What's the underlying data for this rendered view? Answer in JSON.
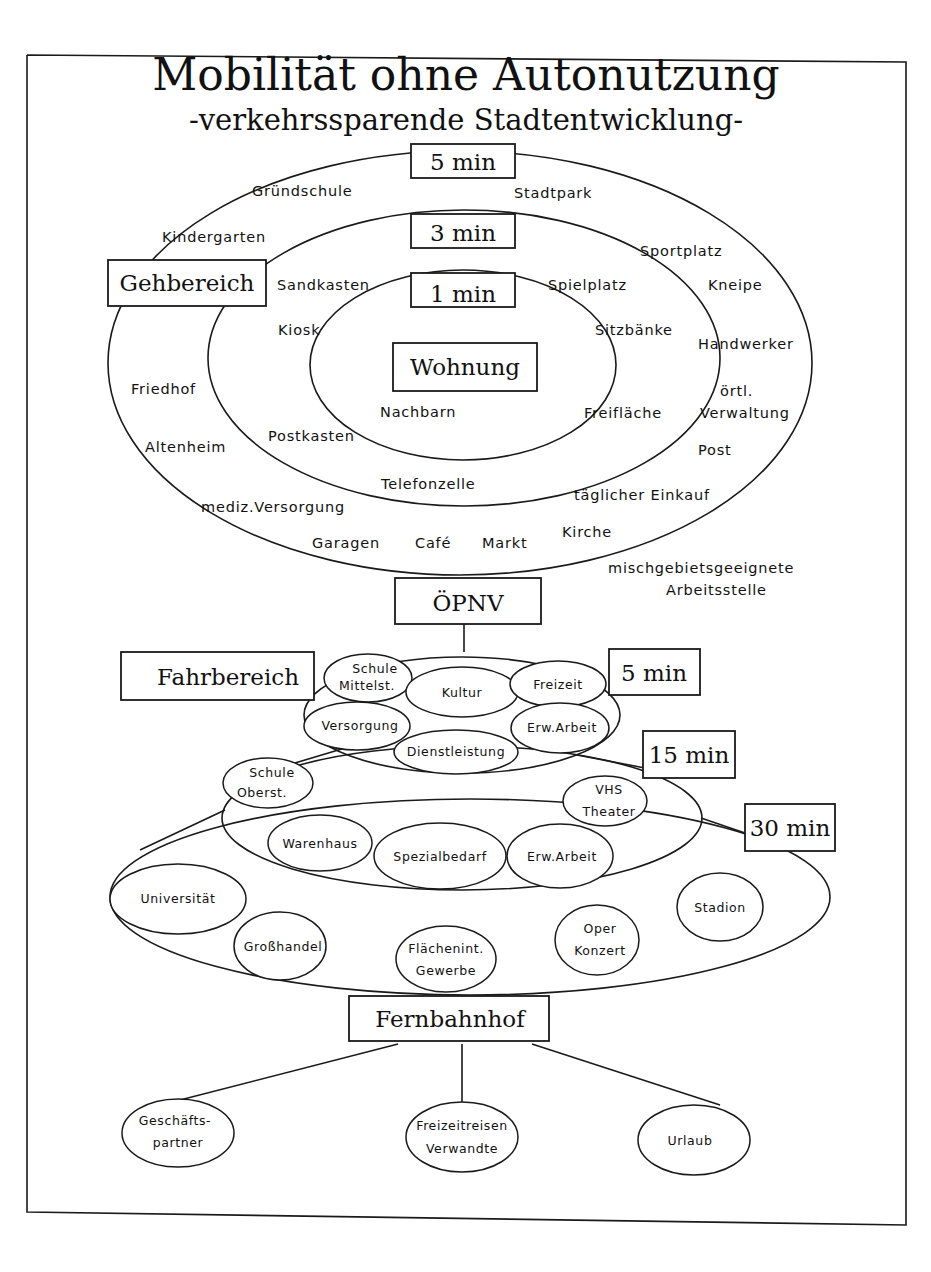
{
  "title": "Mobilität ohne Autonutzung",
  "subtitle": "-verkehrssparende Stadtentwicklung-",
  "gehbereich": {
    "label": "Gehbereich",
    "center_label": "Wohnung",
    "rings": [
      {
        "time": "1 min",
        "items": [
          "Nachbarn"
        ]
      },
      {
        "time": "3 min",
        "items": [
          "Sandkasten",
          "Spielplatz",
          "Kiosk",
          "Sitzbänke",
          "Freifläche",
          "Postkasten",
          "Telefonzelle"
        ]
      },
      {
        "time": "5 min",
        "items": [
          "Gründschule",
          "Stadtpark",
          "Kindergarten",
          "Sportplatz",
          "Kneipe",
          "Handwerker",
          "Friedhof",
          "örtl.",
          "Verwaltung",
          "Altenheim",
          "Post",
          "täglicher Einkauf",
          "mediz.Versorgung",
          "Garagen",
          "Café",
          "Markt",
          "Kirche"
        ]
      }
    ],
    "outside_note": [
      "mischgebietsgeeignete",
      "Arbeitsstelle"
    ]
  },
  "oepnv": {
    "label": "ÖPNV"
  },
  "fahrbereich": {
    "label": "Fahrbereich",
    "rings": [
      {
        "time": "5 min",
        "items": [
          [
            "Schule",
            "Mittelst."
          ],
          [
            "Kultur"
          ],
          [
            "Freizeit"
          ],
          [
            "Versorgung"
          ],
          [
            "Erw.Arbeit"
          ],
          [
            "Dienstleistung"
          ]
        ]
      },
      {
        "time": "15 min",
        "items": [
          [
            "Schule",
            "Oberst."
          ],
          [
            "VHS",
            "Theater"
          ],
          [
            "Warenhaus"
          ],
          [
            "Spezialbedarf"
          ],
          [
            "Erw.Arbeit"
          ]
        ]
      },
      {
        "time": "30 min",
        "items": [
          [
            "Universität"
          ],
          [
            "Stadion"
          ],
          [
            "Großhandel"
          ],
          [
            "Flächenint.",
            "Gewerbe"
          ],
          [
            "Oper",
            "Konzert"
          ]
        ]
      }
    ]
  },
  "fernbahnhof": {
    "label": "Fernbahnhof",
    "destinations": [
      [
        "Geschäfts-",
        "partner"
      ],
      [
        "Freizeitreisen",
        "Verwandte"
      ],
      [
        "Urlaub"
      ]
    ]
  }
}
